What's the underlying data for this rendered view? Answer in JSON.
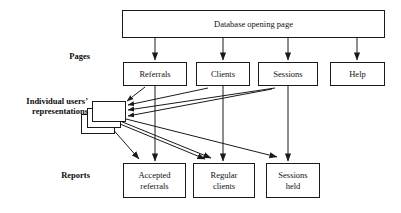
{
  "diagram": {
    "title_node": {
      "label": "Database opening page"
    },
    "row_labels": {
      "pages": "Pages",
      "users": "Individual users’\nrepresentations",
      "reports": "Reports"
    },
    "pages": [
      {
        "id": "referrals",
        "label": "Referrals"
      },
      {
        "id": "clients",
        "label": "Clients"
      },
      {
        "id": "sessions",
        "label": "Sessions"
      },
      {
        "id": "help",
        "label": "Help"
      }
    ],
    "reports": [
      {
        "id": "accepted-referrals",
        "line1": "Accepted",
        "line2": "referrals"
      },
      {
        "id": "regular-clients",
        "line1": "Regular",
        "line2": "clients"
      },
      {
        "id": "sessions-held",
        "line1": "Sessions",
        "line2": "held"
      }
    ],
    "user_stack": {
      "count": 3,
      "label": ""
    },
    "colors": {
      "stroke": "#1a1a1a",
      "fill": "#ffffff",
      "text": "#111111"
    }
  }
}
